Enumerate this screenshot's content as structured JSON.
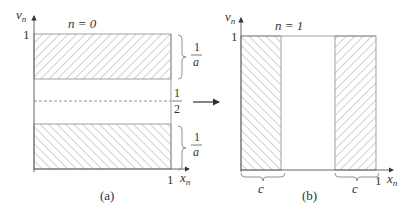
{
  "panel_a": {
    "caption": "(a)",
    "title": "n = 0",
    "y_axis_label": "v",
    "y_axis_sub": "n",
    "x_axis_label": "x",
    "x_axis_sub": "n",
    "y_tick": "1",
    "x_tick": "1",
    "top_band_fraction": {
      "num": "1",
      "den": "a"
    },
    "middle_fraction": {
      "num": "1",
      "den": "2"
    },
    "bottom_band_fraction": {
      "num": "1",
      "den": "a"
    }
  },
  "panel_b": {
    "caption": "(b)",
    "title": "n = 1",
    "y_axis_label": "v",
    "y_axis_sub": "n",
    "x_axis_label": "x",
    "x_axis_sub": "n",
    "y_tick": "1",
    "x_tick": "1",
    "left_band_label": "c",
    "right_band_label": "c"
  },
  "colors": {
    "stroke": "#888888",
    "hatch": "#999999",
    "text": "#333333"
  }
}
